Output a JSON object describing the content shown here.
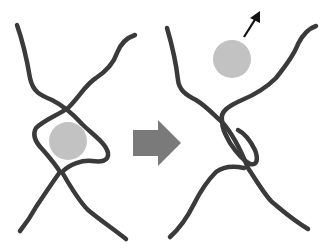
{
  "diagram": {
    "colors": {
      "strand": "#3a3a3a",
      "sphere": "#c2c2c2",
      "transition_arrow": "#7a7a7a",
      "release_arrow": "#111111",
      "background": "#ffffff"
    },
    "panels": [
      {
        "id": "before",
        "state": "sphere trapped inside loop"
      },
      {
        "id": "after",
        "state": "loop closed, sphere released moving up-right"
      }
    ],
    "icons": [
      "transition-arrow-icon",
      "release-arrow-icon"
    ]
  }
}
